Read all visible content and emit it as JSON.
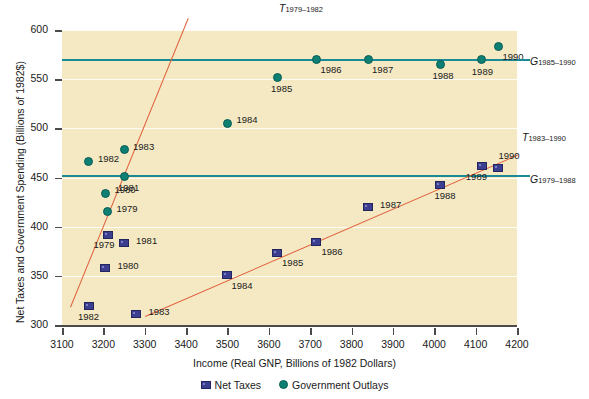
{
  "chart_data": {
    "type": "scatter",
    "title": "",
    "xlabel": "Income (Real GNP, Billions of 1982 Dollars)",
    "ylabel": "Net Taxes and Government Spending (Billions of 1982$)",
    "xlim": [
      3100,
      4200
    ],
    "ylim": [
      300,
      600
    ],
    "xticks": [
      3100,
      3200,
      3300,
      3400,
      3500,
      3600,
      3700,
      3800,
      3900,
      4000,
      4100,
      4200
    ],
    "yticks": [
      300,
      350,
      400,
      450,
      500,
      550,
      600
    ],
    "grid": "horizontal",
    "legend_position": "bottom",
    "series": [
      {
        "name": "Net Taxes",
        "marker": "square",
        "color": "#3c3f8f",
        "points": [
          {
            "label": "1979",
            "x": 3210,
            "y": 392
          },
          {
            "label": "1980",
            "x": 3205,
            "y": 358
          },
          {
            "label": "1981",
            "x": 3250,
            "y": 383
          },
          {
            "label": "1982",
            "x": 3165,
            "y": 319
          },
          {
            "label": "1983",
            "x": 3280,
            "y": 311
          },
          {
            "label": "1984",
            "x": 3500,
            "y": 351
          },
          {
            "label": "1985",
            "x": 3620,
            "y": 373
          },
          {
            "label": "1986",
            "x": 3715,
            "y": 384
          },
          {
            "label": "1987",
            "x": 3840,
            "y": 420
          },
          {
            "label": "1988",
            "x": 4015,
            "y": 442
          },
          {
            "label": "1989",
            "x": 4115,
            "y": 462
          },
          {
            "label": "1990",
            "x": 4155,
            "y": 460
          }
        ]
      },
      {
        "name": "Government Outlays",
        "marker": "circle",
        "color": "#0e8073",
        "points": [
          {
            "label": "1979",
            "x": 3210,
            "y": 415
          },
          {
            "label": "1980",
            "x": 3205,
            "y": 434
          },
          {
            "label": "1981",
            "x": 3250,
            "y": 451
          },
          {
            "label": "1982",
            "x": 3165,
            "y": 466
          },
          {
            "label": "1983",
            "x": 3250,
            "y": 478
          },
          {
            "label": "1984",
            "x": 3500,
            "y": 505
          },
          {
            "label": "1985",
            "x": 3620,
            "y": 552
          },
          {
            "label": "1986",
            "x": 3715,
            "y": 570
          },
          {
            "label": "1987",
            "x": 3840,
            "y": 570
          },
          {
            "label": "1988",
            "x": 4015,
            "y": 565
          },
          {
            "label": "1989",
            "x": 4115,
            "y": 570
          },
          {
            "label": "1990",
            "x": 4155,
            "y": 583
          }
        ]
      }
    ],
    "trendlines": [
      {
        "name": "T_1979-1982",
        "label_main": "T",
        "label_sub": "1979–1982",
        "color": "#e0603c",
        "x0": 3120,
        "y0": 318,
        "x1": 3405,
        "y1": 612
      },
      {
        "name": "T_1983-1990",
        "label_main": "T",
        "label_sub": "1983–1990",
        "color": "#e0603c",
        "x0": 3300,
        "y0": 309,
        "x1": 4200,
        "y1": 473
      }
    ],
    "hlines": [
      {
        "name": "G_1985-1990",
        "label_main": "G",
        "label_sub": "1985–1990",
        "color": "#1a8a97",
        "value": 570
      },
      {
        "name": "G_1979-1988",
        "label_main": "G",
        "label_sub": "1979–1988",
        "color": "#1a8a97",
        "value": 452
      }
    ],
    "legend": [
      {
        "name": "Net Taxes",
        "marker": "square"
      },
      {
        "name": "Government Outlays",
        "marker": "circle"
      }
    ],
    "colors": {
      "plot_background": "#f5e9c4",
      "net_taxes": "#3c3f8f",
      "government_outlays": "#0e8073",
      "trend": "#e0603c",
      "hline": "#1a8a97",
      "gridline": "#ffffff",
      "axis": "#4a4a4a"
    }
  }
}
